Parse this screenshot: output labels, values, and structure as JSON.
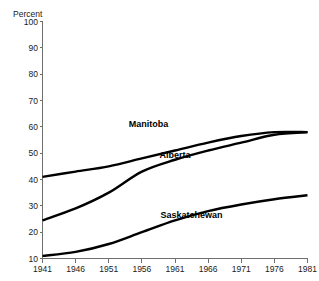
{
  "chart_data": {
    "type": "line",
    "title": "",
    "subtitle": "",
    "xlabel": "",
    "ylabel": "Percent",
    "grid": false,
    "legend_position": "inline-annotations",
    "x": [
      1941,
      1946,
      1951,
      1956,
      1961,
      1966,
      1971,
      1976,
      1981
    ],
    "xlim": [
      1941,
      1981
    ],
    "ylim": [
      10,
      100
    ],
    "x_ticks": [
      "1941",
      "1946",
      "1951",
      "1956",
      "1961",
      "1966",
      "1971",
      "1976",
      "1981"
    ],
    "y_ticks": [
      "100",
      "90",
      "80",
      "70",
      "60",
      "50",
      "40",
      "30",
      "20",
      "10"
    ],
    "y_tick_values": [
      100,
      90,
      80,
      70,
      60,
      50,
      40,
      30,
      20,
      10
    ],
    "series": [
      {
        "name": "Manitoba",
        "color": "#000000",
        "values": [
          41,
          43,
          45,
          48,
          51,
          54,
          56.5,
          58,
          58
        ]
      },
      {
        "name": "Alberta",
        "color": "#000000",
        "values": [
          24.5,
          29,
          35,
          43,
          47.5,
          51,
          54,
          57,
          58
        ]
      },
      {
        "name": "Saskatchewan",
        "color": "#000000",
        "values": [
          11,
          12.5,
          15.5,
          20,
          24.5,
          28,
          30.5,
          32.5,
          34
        ]
      }
    ],
    "annotations": [
      {
        "text": "Manitoba",
        "x": 1957,
        "y": 60
      },
      {
        "text": "Alberta",
        "x": 1961,
        "y": 48
      },
      {
        "text": "Saskatchewan",
        "x": 1963.5,
        "y": 25.5
      }
    ]
  }
}
